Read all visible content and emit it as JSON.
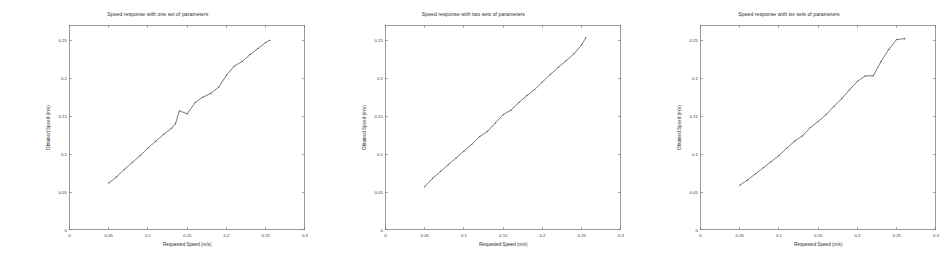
{
  "figure": {
    "background_color": "#ffffff",
    "line_color": "#4a4a4a",
    "axis_color": "#6f6f6f",
    "panel_count": 3
  },
  "chart_data": [
    {
      "type": "line",
      "title": "Speed response with one set of parameters",
      "xlabel": "Requested Speed (m/s)",
      "ylabel": "Obtained Speed (m/s)",
      "xlim": [
        0,
        0.3
      ],
      "ylim": [
        0,
        0.27
      ],
      "xticks": [
        0,
        0.05,
        0.1,
        0.15,
        0.2,
        0.25,
        0.3
      ],
      "xticklabels": [
        "0",
        "0.05",
        "0.1",
        "0.15",
        "0.2",
        "0.25",
        "0.3"
      ],
      "yticks": [
        0,
        0.05,
        0.1,
        0.15,
        0.2,
        0.25
      ],
      "yticklabels": [
        "0",
        "0.05",
        "0.1",
        "0.15",
        "0.2",
        "0.25"
      ],
      "grid": false,
      "legend": null,
      "series": [
        {
          "name": "measured speed",
          "marker": "point",
          "x": [
            0.05,
            0.06,
            0.07,
            0.08,
            0.09,
            0.1,
            0.11,
            0.12,
            0.13,
            0.135,
            0.14,
            0.15,
            0.16,
            0.17,
            0.18,
            0.19,
            0.2,
            0.21,
            0.22,
            0.23,
            0.24,
            0.25,
            0.255
          ],
          "y": [
            0.062,
            0.07,
            0.08,
            0.089,
            0.098,
            0.108,
            0.117,
            0.126,
            0.134,
            0.14,
            0.157,
            0.153,
            0.168,
            0.175,
            0.18,
            0.188,
            0.204,
            0.216,
            0.222,
            0.231,
            0.239,
            0.247,
            0.25
          ]
        }
      ]
    },
    {
      "type": "line",
      "title": "Speed response with two sets of parameters",
      "xlabel": "Requested Speed (m/s)",
      "ylabel": "Obtained Speed (m/s)",
      "xlim": [
        0,
        0.3
      ],
      "ylim": [
        0,
        0.27
      ],
      "xticks": [
        0,
        0.05,
        0.1,
        0.15,
        0.2,
        0.25,
        0.3
      ],
      "xticklabels": [
        "0",
        "0.05",
        "0.1",
        "0.15",
        "0.2",
        "0.25",
        "0.3"
      ],
      "yticks": [
        0,
        0.05,
        0.1,
        0.15,
        0.2,
        0.25
      ],
      "yticklabels": [
        "0",
        "0.05",
        "0.1",
        "0.15",
        "0.2",
        "0.25"
      ],
      "grid": false,
      "legend": null,
      "series": [
        {
          "name": "measured speed",
          "marker": "point",
          "x": [
            0.05,
            0.06,
            0.07,
            0.08,
            0.09,
            0.1,
            0.11,
            0.12,
            0.13,
            0.14,
            0.15,
            0.16,
            0.17,
            0.18,
            0.19,
            0.2,
            0.21,
            0.22,
            0.23,
            0.24,
            0.25,
            0.255
          ],
          "y": [
            0.057,
            0.068,
            0.077,
            0.086,
            0.095,
            0.104,
            0.113,
            0.123,
            0.13,
            0.141,
            0.152,
            0.158,
            0.168,
            0.177,
            0.185,
            0.195,
            0.205,
            0.214,
            0.223,
            0.232,
            0.244,
            0.253
          ]
        }
      ]
    },
    {
      "type": "line",
      "title": "Speed response with six sets of parameters",
      "xlabel": "Requested Speed (m/s)",
      "ylabel": "Obtained Speed (m/s)",
      "xlim": [
        0,
        0.3
      ],
      "ylim": [
        0,
        0.27
      ],
      "xticks": [
        0,
        0.05,
        0.1,
        0.15,
        0.2,
        0.25,
        0.3
      ],
      "xticklabels": [
        "0",
        "0.05",
        "0.1",
        "0.15",
        "0.2",
        "0.25",
        "0.3"
      ],
      "yticks": [
        0,
        0.05,
        0.1,
        0.15,
        0.2,
        0.25
      ],
      "yticklabels": [
        "0",
        "0.05",
        "0.1",
        "0.15",
        "0.2",
        "0.25"
      ],
      "grid": false,
      "legend": null,
      "series": [
        {
          "name": "measured speed",
          "marker": "point",
          "x": [
            0.05,
            0.06,
            0.07,
            0.08,
            0.09,
            0.1,
            0.11,
            0.12,
            0.13,
            0.14,
            0.15,
            0.16,
            0.17,
            0.18,
            0.19,
            0.2,
            0.21,
            0.22,
            0.23,
            0.24,
            0.25,
            0.26
          ],
          "y": [
            0.059,
            0.066,
            0.074,
            0.082,
            0.09,
            0.098,
            0.108,
            0.117,
            0.124,
            0.135,
            0.143,
            0.152,
            0.163,
            0.173,
            0.185,
            0.196,
            0.203,
            0.203,
            0.222,
            0.238,
            0.251,
            0.252
          ]
        }
      ]
    }
  ]
}
